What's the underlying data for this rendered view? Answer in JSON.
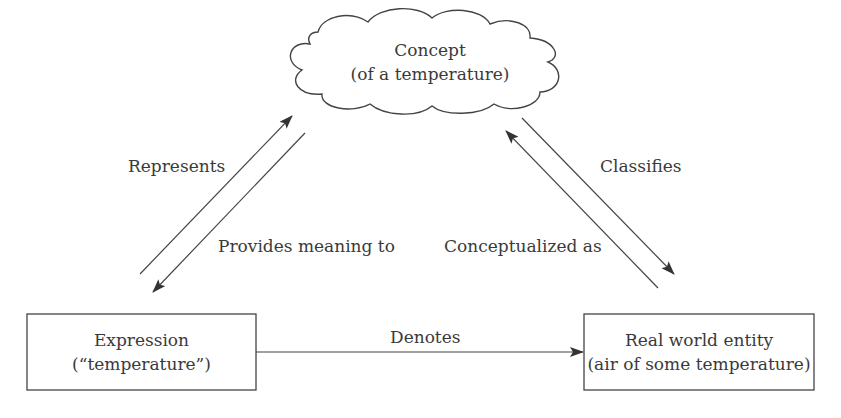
{
  "diagram": {
    "type": "semiotic-triangle",
    "nodes": {
      "concept": {
        "line1": "Concept",
        "line2": "(of a temperature)",
        "shape": "cloud"
      },
      "expression": {
        "line1": "Expression",
        "line2": "(“temperature”)",
        "shape": "rectangle"
      },
      "entity": {
        "line1": "Real world entity",
        "line2": "(air of some temperature)",
        "shape": "rectangle"
      }
    },
    "edges": {
      "represents": {
        "label": "Represents",
        "from": "expression",
        "to": "concept"
      },
      "provides_meaning": {
        "label": "Provides meaning to",
        "from": "concept",
        "to": "expression"
      },
      "classifies": {
        "label": "Classifies",
        "from": "concept",
        "to": "entity"
      },
      "conceptualized": {
        "label": "Conceptualized as",
        "from": "entity",
        "to": "concept"
      },
      "denotes": {
        "label": "Denotes",
        "from": "expression",
        "to": "entity"
      }
    },
    "colors": {
      "stroke": "#444444",
      "text": "#3a3a3a",
      "background": "#ffffff"
    }
  }
}
